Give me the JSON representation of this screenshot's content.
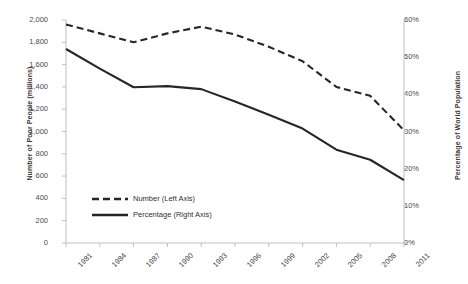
{
  "chart_data": {
    "type": "line",
    "title": "",
    "xlabel": "",
    "ylabel": "Number of Poor People (millions)",
    "y2label": "Percentage of World Population",
    "categories": [
      "1981",
      "1984",
      "1987",
      "1990",
      "1993",
      "1996",
      "1999",
      "2002",
      "2005",
      "2008",
      "2011"
    ],
    "x": [
      1981,
      1984,
      1987,
      1990,
      1993,
      1996,
      1999,
      2002,
      2005,
      2008,
      2011
    ],
    "ylim": [
      0,
      2000
    ],
    "y2lim": [
      0,
      60
    ],
    "yticks": [
      0,
      200,
      400,
      600,
      800,
      1000,
      1200,
      1400,
      1600,
      1800,
      2000
    ],
    "ytick_labels": [
      "0",
      "200",
      "400",
      "600",
      "800",
      "1,000",
      "1,200",
      "1,400",
      "1,600",
      "1,800",
      "2,000"
    ],
    "y2ticks": [
      0,
      10,
      20,
      30,
      40,
      50,
      60
    ],
    "y2tick_labels": [
      "0%",
      "10%",
      "20%",
      "30%",
      "40%",
      "50%",
      "60%"
    ],
    "grid": false,
    "legend_position": "center-left-lower",
    "series": [
      {
        "name": "Number (Left Axis)",
        "axis": "left",
        "style": "dashed",
        "color": "#262626",
        "values": [
          1960,
          1880,
          1800,
          1880,
          1940,
          1870,
          1760,
          1630,
          1400,
          1320,
          1010
        ]
      },
      {
        "name": "Percentage (Right Axis)",
        "axis": "right",
        "style": "solid",
        "color": "#262626",
        "values": [
          52.2,
          46.9,
          41.9,
          42.2,
          41.4,
          38.1,
          34.5,
          30.8,
          25.1,
          22.4,
          16.9
        ]
      }
    ]
  },
  "legend": {
    "items": [
      {
        "label": "Number (Left Axis)",
        "style": "dashed"
      },
      {
        "label": "Percentage (Right Axis)",
        "style": "solid"
      }
    ]
  },
  "axes": {
    "left_title": "Number of Poor People (millions)",
    "right_title": "Percentage of World Population"
  }
}
